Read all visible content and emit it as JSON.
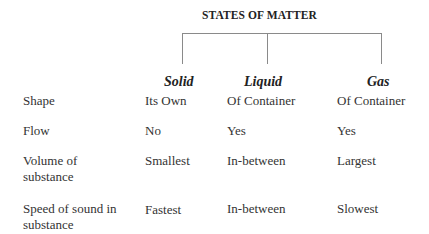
{
  "title": "STATES OF MATTER",
  "columns": [
    {
      "label": "Solid"
    },
    {
      "label": "Liquid"
    },
    {
      "label": "Gas"
    }
  ],
  "rows": [
    {
      "label": "Shape",
      "values": [
        "Its Own",
        "Of Container",
        "Of Container"
      ]
    },
    {
      "label": "Flow",
      "values": [
        "No",
        "Yes",
        "Yes"
      ]
    },
    {
      "label_line1": "Volume of",
      "label_line2": "substance",
      "values": [
        "Smallest",
        "In-between",
        "Largest"
      ]
    },
    {
      "label_line1": "Speed of sound in",
      "label_line2": "substance",
      "values": [
        "Fastest",
        "In-between",
        "Slowest"
      ]
    }
  ]
}
